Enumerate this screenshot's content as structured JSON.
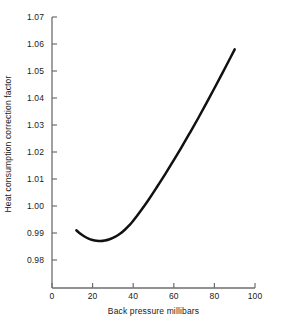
{
  "chart_data": {
    "type": "line",
    "title": "",
    "xlabel": "Back pressure millibars",
    "ylabel": "Heat consumption correction factor",
    "xlim": [
      0,
      100
    ],
    "ylim": [
      0.975,
      1.072
    ],
    "xticks": [
      0,
      20,
      40,
      60,
      80,
      100
    ],
    "xtick_labels": [
      "0",
      "20",
      "40",
      "60",
      "80",
      "100"
    ],
    "yticks": [
      0.98,
      0.99,
      1.0,
      1.01,
      1.02,
      1.03,
      1.04,
      1.05,
      1.06,
      1.07
    ],
    "ytick_labels": [
      "0.98",
      "0.99",
      "1.00",
      "1.01",
      "1.02",
      "1.03",
      "1.04",
      "1.05",
      "1.06",
      "1.07"
    ],
    "grid": false,
    "legend": null,
    "series": [
      {
        "name": "Heat consumption correction factor",
        "color": "#111111",
        "linewidth": 2.5,
        "x": [
          12,
          14,
          16,
          18,
          20,
          22,
          24,
          26,
          28,
          30,
          32,
          34,
          36,
          38,
          40,
          44,
          48,
          52,
          56,
          60,
          64,
          68,
          72,
          76,
          80,
          84,
          88,
          90
        ],
        "y": [
          0.991,
          0.9897,
          0.9887,
          0.9879,
          0.9874,
          0.9871,
          0.987,
          0.9872,
          0.9876,
          0.9882,
          0.989,
          0.99,
          0.9913,
          0.9928,
          0.9945,
          0.9985,
          1.0028,
          1.0074,
          1.0121,
          1.017,
          1.022,
          1.0272,
          1.0325,
          1.038,
          1.0436,
          1.0493,
          1.0551,
          1.058
        ]
      }
    ],
    "annotations": []
  },
  "axes": {
    "spine_color": "#6e6e6e",
    "tick_color": "#6e6e6e",
    "background": "#ffffff"
  }
}
